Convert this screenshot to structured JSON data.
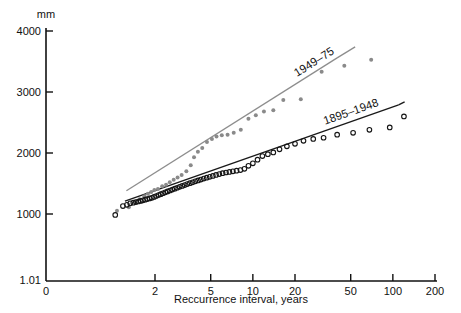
{
  "chart_data": {
    "type": "scatter",
    "title": "",
    "xlabel": "Reccurrence interval, years",
    "ylabel": "mm",
    "y_unit_label": "mm",
    "x_scale": "log",
    "y_scale": "linear",
    "grid": false,
    "legend": "inline-annotations",
    "xticks": [
      0,
      2,
      5,
      10,
      20,
      50,
      100,
      200
    ],
    "xtick_labels": [
      "0",
      "2",
      "5",
      "10",
      "20",
      "50",
      "100",
      "200"
    ],
    "yticks": [
      1000,
      2000,
      3000,
      4000
    ],
    "ytick_labels": [
      "1000",
      "2000",
      "3000",
      "4000"
    ],
    "y_axis_origin_label": "1.01",
    "ylim": [
      1010,
      4000
    ],
    "xlim": [
      1.01,
      200
    ],
    "series": [
      {
        "name": "1949-75",
        "marker": "filled-circle",
        "color": "#8a8a8a",
        "annotation": "1949–75",
        "fit_line": {
          "x1": 1.25,
          "y1": 1380,
          "x2": 40.0,
          "y2": 3560
        },
        "points": [
          [
            1.07,
            1055
          ],
          [
            1.3,
            1110
          ],
          [
            1.45,
            1200
          ],
          [
            1.55,
            1240
          ],
          [
            1.68,
            1290
          ],
          [
            1.78,
            1330
          ],
          [
            1.88,
            1360
          ],
          [
            1.98,
            1395
          ],
          [
            2.1,
            1410
          ],
          [
            2.25,
            1455
          ],
          [
            2.4,
            1480
          ],
          [
            2.55,
            1520
          ],
          [
            2.72,
            1560
          ],
          [
            2.9,
            1600
          ],
          [
            3.1,
            1640
          ],
          [
            3.35,
            1700
          ],
          [
            3.6,
            1800
          ],
          [
            3.8,
            1930
          ],
          [
            4.05,
            2020
          ],
          [
            4.35,
            2080
          ],
          [
            4.7,
            2180
          ],
          [
            5.1,
            2230
          ],
          [
            5.5,
            2270
          ],
          [
            6.0,
            2290
          ],
          [
            6.6,
            2300
          ],
          [
            7.3,
            2330
          ],
          [
            8.2,
            2380
          ],
          [
            9.3,
            2560
          ],
          [
            10.5,
            2620
          ],
          [
            12.0,
            2680
          ],
          [
            14.0,
            2700
          ],
          [
            16.5,
            2870
          ],
          [
            22.0,
            2880
          ],
          [
            31.0,
            3330
          ],
          [
            45.0,
            3430
          ],
          [
            70.0,
            3530
          ]
        ]
      },
      {
        "name": "1895-1948",
        "marker": "open-circle",
        "color": "#151515",
        "annotation": "1895–1948",
        "fit_line": {
          "x1": 1.22,
          "y1": 1210,
          "x2": 110.0,
          "y2": 2790
        },
        "points": [
          [
            1.04,
            985
          ],
          [
            1.18,
            1130
          ],
          [
            1.26,
            1150
          ],
          [
            1.33,
            1175
          ],
          [
            1.4,
            1185
          ],
          [
            1.46,
            1195
          ],
          [
            1.52,
            1205
          ],
          [
            1.58,
            1215
          ],
          [
            1.64,
            1225
          ],
          [
            1.7,
            1235
          ],
          [
            1.76,
            1245
          ],
          [
            1.83,
            1255
          ],
          [
            1.9,
            1265
          ],
          [
            1.97,
            1280
          ],
          [
            2.04,
            1295
          ],
          [
            2.12,
            1310
          ],
          [
            2.2,
            1325
          ],
          [
            2.28,
            1340
          ],
          [
            2.37,
            1355
          ],
          [
            2.46,
            1370
          ],
          [
            2.56,
            1385
          ],
          [
            2.66,
            1400
          ],
          [
            2.77,
            1415
          ],
          [
            2.88,
            1430
          ],
          [
            3.0,
            1445
          ],
          [
            3.13,
            1460
          ],
          [
            3.26,
            1475
          ],
          [
            3.4,
            1490
          ],
          [
            3.55,
            1505
          ],
          [
            3.71,
            1520
          ],
          [
            3.88,
            1535
          ],
          [
            4.06,
            1550
          ],
          [
            4.25,
            1565
          ],
          [
            4.46,
            1580
          ],
          [
            4.68,
            1595
          ],
          [
            4.92,
            1610
          ],
          [
            5.18,
            1625
          ],
          [
            5.46,
            1640
          ],
          [
            5.76,
            1655
          ],
          [
            6.08,
            1670
          ],
          [
            6.43,
            1680
          ],
          [
            6.8,
            1690
          ],
          [
            7.2,
            1700
          ],
          [
            7.65,
            1710
          ],
          [
            8.15,
            1720
          ],
          [
            8.7,
            1740
          ],
          [
            9.3,
            1790
          ],
          [
            10.0,
            1830
          ],
          [
            10.8,
            1890
          ],
          [
            11.7,
            1950
          ],
          [
            12.8,
            1980
          ],
          [
            14.0,
            2010
          ],
          [
            15.5,
            2060
          ],
          [
            17.5,
            2110
          ],
          [
            20.0,
            2150
          ],
          [
            23.0,
            2200
          ],
          [
            27.0,
            2230
          ],
          [
            32.0,
            2250
          ],
          [
            40.0,
            2300
          ],
          [
            52.0,
            2330
          ],
          [
            68.0,
            2380
          ],
          [
            95.0,
            2420
          ],
          [
            120.0,
            2600
          ]
        ]
      }
    ]
  },
  "axis": {
    "y_unit": "mm",
    "x_title": "Reccurrence interval, years",
    "origin_label": "1.01"
  },
  "annotations": {
    "upper_series": "1949–75",
    "lower_series": "1895–1948"
  },
  "colors": {
    "axis": "#111111",
    "series_new": "#8a8a8a",
    "series_old": "#151515",
    "background": "#ffffff"
  }
}
